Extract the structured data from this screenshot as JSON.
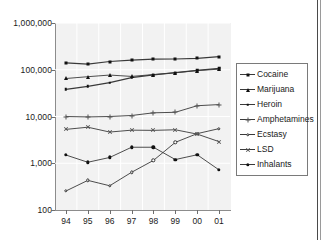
{
  "chart_data": {
    "type": "line",
    "title": "",
    "xlabel": "",
    "ylabel": "",
    "x": [
      "94",
      "95",
      "96",
      "97",
      "98",
      "99",
      "00",
      "01"
    ],
    "categories": [
      "94",
      "95",
      "96",
      "97",
      "98",
      "99",
      "00",
      "01"
    ],
    "yscale": "log",
    "ylim": [
      100,
      1000000
    ],
    "ytick_labels": [
      "1,000,000",
      "100,000",
      "10,000",
      "1,000",
      "100"
    ],
    "ytick_values": [
      1000000,
      100000,
      10000,
      1000,
      100
    ],
    "grid": true,
    "legend_position": "right",
    "series": [
      {
        "name": "Cocaine",
        "marker": "filled-square",
        "values": [
          140000,
          132000,
          150000,
          160000,
          168000,
          170000,
          175000,
          190000
        ]
      },
      {
        "name": "Marijuana",
        "marker": "filled-triangle",
        "values": [
          65000,
          71000,
          77000,
          72000,
          79000,
          86000,
          96000,
          103000
        ]
      },
      {
        "name": "Heroin",
        "marker": "filled-square-small",
        "values": [
          38000,
          44000,
          53000,
          68000,
          78000,
          87000,
          97000,
          107000
        ]
      },
      {
        "name": "Amphetamines",
        "marker": "plus",
        "values": [
          10000,
          9800,
          10000,
          10500,
          12000,
          12300,
          17000,
          18000
        ]
      },
      {
        "name": "Ecstasy",
        "marker": "open-circle",
        "values": [
          255,
          430,
          330,
          640,
          1150,
          2800,
          4300,
          5500
        ]
      },
      {
        "name": "LSD",
        "marker": "x-cross",
        "values": [
          5300,
          5900,
          4650,
          5100,
          5050,
          5200,
          4200,
          2900
        ]
      },
      {
        "name": "Inhalants",
        "marker": "filled-circle",
        "values": [
          1500,
          1050,
          1330,
          2200,
          2200,
          1200,
          1520,
          720
        ]
      }
    ]
  },
  "legend": {
    "items": [
      {
        "label": "Cocaine"
      },
      {
        "label": "Marijuana"
      },
      {
        "label": "Heroin"
      },
      {
        "label": "Amphetamines"
      },
      {
        "label": "Ecstasy"
      },
      {
        "label": "LSD"
      },
      {
        "label": "Inhalants"
      }
    ]
  },
  "colors": {
    "plot_background": "#f2f2f2",
    "grid": "#ffffff",
    "axis": "#8c8c8c",
    "text": "#1a1a1a",
    "line": "#3a3a3a"
  }
}
